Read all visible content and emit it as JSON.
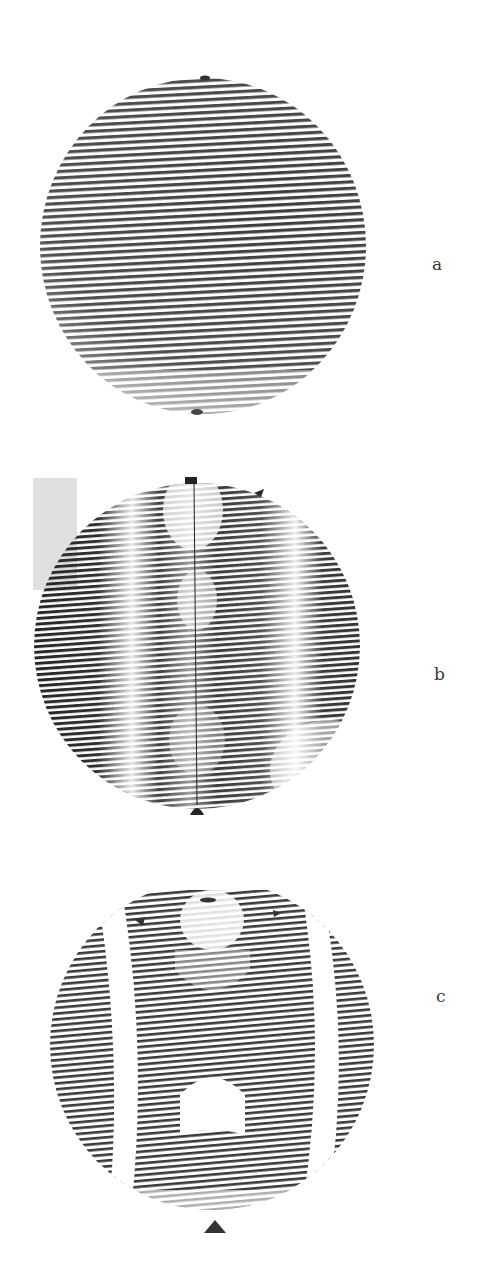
{
  "figure": {
    "panels": [
      {
        "id": "a",
        "label": "a",
        "description": "Interference fringe pattern, nearly straight horizontal fringes across circular aperture",
        "fringe_color": "#3c3c3c",
        "fringe_count_approx": 52
      },
      {
        "id": "b",
        "label": "b",
        "description": "Interferogram with moire-like modulated fringes, dark lobes, central vertical line, markers at top and bottom",
        "fringe_color": "#2a2a2a",
        "fringe_count_approx": 60
      },
      {
        "id": "c",
        "label": "c",
        "description": "Interferogram showing fringe bands separated by white curved zones, triangle marker below",
        "fringe_color": "#3a3a3a",
        "fringe_count_approx": 58
      }
    ]
  }
}
